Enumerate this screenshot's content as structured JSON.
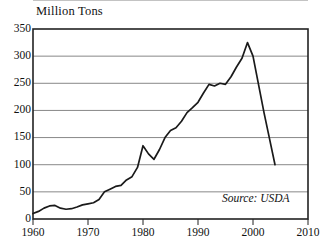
{
  "chart_data": {
    "type": "line",
    "title": "Million Tons",
    "xlabel": "",
    "ylabel": "Million Tons",
    "xlim": [
      1960,
      2010
    ],
    "ylim": [
      0,
      350
    ],
    "grid": true,
    "legend": null,
    "annotation": "Source: USDA",
    "y_ticks": [
      0,
      50,
      100,
      150,
      200,
      250,
      300,
      350
    ],
    "x_ticks": [
      1960,
      1970,
      1980,
      1990,
      2000,
      2010
    ],
    "series": [
      {
        "name": "Production",
        "x": [
          1960,
          1961,
          1962,
          1963,
          1964,
          1965,
          1966,
          1967,
          1968,
          1969,
          1970,
          1971,
          1972,
          1973,
          1974,
          1975,
          1976,
          1977,
          1978,
          1979,
          1980,
          1981,
          1982,
          1983,
          1984,
          1985,
          1986,
          1987,
          1988,
          1989,
          1990,
          1991,
          1992,
          1993,
          1994,
          1995,
          1996,
          1997,
          1998,
          1999,
          2000,
          2001,
          2002,
          2003,
          2004
        ],
        "values": [
          10,
          14,
          20,
          24,
          25,
          20,
          18,
          19,
          22,
          26,
          28,
          30,
          36,
          50,
          55,
          60,
          62,
          72,
          78,
          95,
          135,
          120,
          110,
          128,
          150,
          163,
          168,
          180,
          196,
          205,
          215,
          232,
          248,
          245,
          250,
          248,
          262,
          280,
          296,
          325,
          300,
          248,
          196,
          148,
          100
        ]
      }
    ]
  }
}
